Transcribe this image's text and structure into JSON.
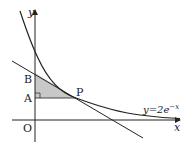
{
  "diagram": {
    "type": "function-graph",
    "curve_label": "y=2e",
    "curve_exponent": "−x",
    "axis_x_label": "x",
    "axis_y_label": "y",
    "origin_label": "O",
    "points": {
      "A": "A",
      "B": "B",
      "P": "P"
    },
    "colors": {
      "line": "#222222",
      "shade": "#c8c8c8"
    }
  }
}
